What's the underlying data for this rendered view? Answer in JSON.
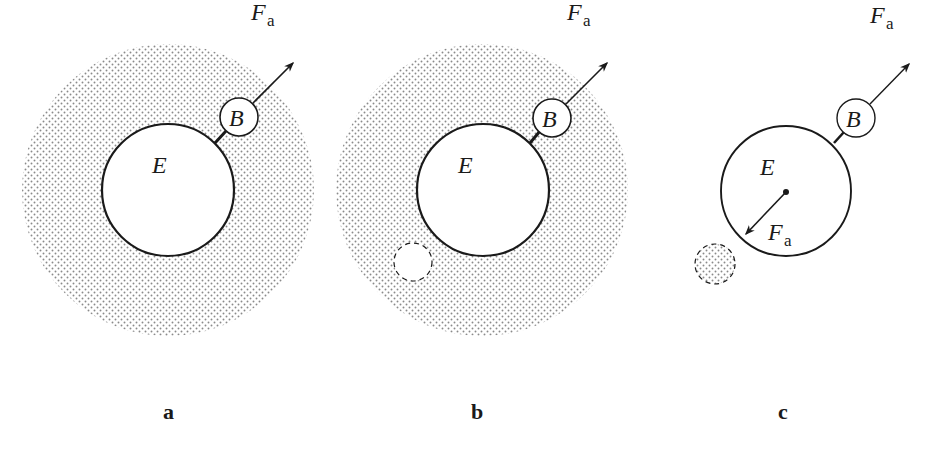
{
  "figure": {
    "colors": {
      "ink": "#1a1a1a",
      "stipple": "#8a8a8a",
      "background": "#ffffff"
    },
    "panels": [
      {
        "id": "a",
        "label": "a",
        "large_body_label": "E",
        "small_body_label": "B",
        "force_label_main": "F",
        "force_label_sub": "a",
        "has_cloud": true,
        "has_dashed_hole": false,
        "has_reaction_force": false
      },
      {
        "id": "b",
        "label": "b",
        "large_body_label": "E",
        "small_body_label": "B",
        "force_label_main": "F",
        "force_label_sub": "a",
        "has_cloud": true,
        "has_dashed_hole": true,
        "has_reaction_force": false
      },
      {
        "id": "c",
        "label": "c",
        "large_body_label": "E",
        "small_body_label": "B",
        "force_label_main": "F",
        "force_label_sub": "a",
        "reaction_force_label_main": "F",
        "reaction_force_label_sub": "a",
        "has_cloud": false,
        "has_dashed_hole": true,
        "has_reaction_force": true
      }
    ]
  }
}
